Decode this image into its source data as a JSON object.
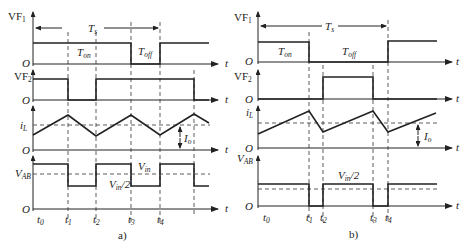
{
  "figure": {
    "panels": [
      {
        "id": "a",
        "caption": "a)",
        "period_label": "T",
        "period_sub": "s",
        "ton_label": "T",
        "ton_sub": "on",
        "toff_label": "T",
        "toff_sub": "off",
        "signals": [
          {
            "name": "VF",
            "sub": "1"
          },
          {
            "name": "VF",
            "sub": "2"
          },
          {
            "name": "i",
            "sub": "L"
          },
          {
            "name": "V",
            "sub": "AB"
          }
        ],
        "origin_label": "O",
        "time_axis_label": "t",
        "io_label": "I",
        "io_sub": "o",
        "vin_label": "V",
        "vin_sub": "in",
        "vin_half_label": "V",
        "vin_half_sub": "in",
        "vin_half_suffix": "/2",
        "time_marks": [
          {
            "name": "t",
            "sub": "0"
          },
          {
            "name": "t",
            "sub": "1"
          },
          {
            "name": "t",
            "sub": "2"
          },
          {
            "name": "t",
            "sub": "3"
          },
          {
            "name": "t",
            "sub": "4"
          }
        ]
      },
      {
        "id": "b",
        "caption": "b)",
        "period_label": "T",
        "period_sub": "s",
        "ton_label": "T",
        "ton_sub": "on",
        "toff_label": "T",
        "toff_sub": "off",
        "signals": [
          {
            "name": "VF",
            "sub": "1"
          },
          {
            "name": "VF",
            "sub": "2"
          },
          {
            "name": "i",
            "sub": "L"
          },
          {
            "name": "V",
            "sub": "AB"
          }
        ],
        "origin_label": "O",
        "time_axis_label": "t",
        "io_label": "I",
        "io_sub": "o",
        "vin_half_label": "V",
        "vin_half_sub": "in",
        "vin_half_suffix": "/2",
        "time_marks": [
          {
            "name": "t",
            "sub": "0"
          },
          {
            "name": "t",
            "sub": "1"
          },
          {
            "name": "t",
            "sub": "2"
          },
          {
            "name": "t",
            "sub": "3"
          },
          {
            "name": "t",
            "sub": "4"
          }
        ]
      }
    ]
  }
}
